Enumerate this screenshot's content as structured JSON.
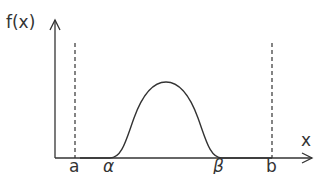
{
  "diagram": {
    "y_axis_label": "f(x)",
    "x_axis_label": "x",
    "markers": {
      "a": "a",
      "alpha": "α",
      "beta": "β",
      "b": "b"
    }
  }
}
